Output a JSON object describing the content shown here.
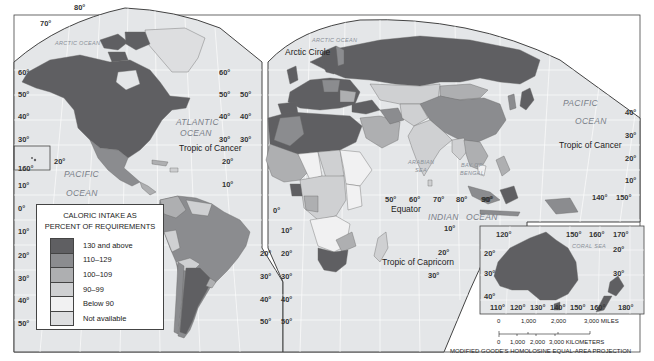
{
  "map": {
    "title": "Caloric intake as percent of requirements",
    "projection": "MODIFIED GOODE'S HOMOLOSINE EQUAL-AREA PROJECTION",
    "colors": {
      "frame": "#444444",
      "ocean": "#e4e6e8",
      "grid": "#ffffff",
      "cat_130_plus": "#5f5f62",
      "cat_110_129": "#8b8c8f",
      "cat_100_109": "#aeafb1",
      "cat_90_99": "#cfd0d2",
      "cat_below_90": "#f1f1f2",
      "cat_na": "#dddee0"
    }
  },
  "legend": {
    "title_line1": "CALORIC INTAKE AS",
    "title_line2": "PERCENT OF REQUIREMENTS",
    "items": [
      {
        "label": "130 and above",
        "color": "#5f5f62"
      },
      {
        "label": "110–129",
        "color": "#8b8c8f"
      },
      {
        "label": "100–109",
        "color": "#aeafb1"
      },
      {
        "label": "90–99",
        "color": "#cfd0d2"
      },
      {
        "label": "Below 90",
        "color": "#f1f1f2"
      },
      {
        "label": "Not available",
        "color": "#dddee0"
      }
    ]
  },
  "labels": {
    "oceans": {
      "arctic_west": "ARCTIC OCEAN",
      "arctic_east": "ARCTIC OCEAN",
      "atlantic_1": "ATLANTIC",
      "atlantic_2": "OCEAN",
      "pacific_west_1": "PACIFIC",
      "pacific_west_2": "OCEAN",
      "pacific_east_1": "PACIFIC",
      "pacific_east_2": "OCEAN",
      "indian_1": "INDIAN",
      "indian_2": "OCEAN",
      "arabian_1": "ARABIAN",
      "arabian_2": "SEA",
      "bengal_1": "BAY OF",
      "bengal_2": "BENGAL",
      "coral": "CORAL SEA"
    },
    "lines": {
      "arctic_circle": "Arctic Circle",
      "tropic_cancer_atlantic": "Tropic of Cancer",
      "tropic_cancer_pacific": "Tropic of Cancer",
      "equator": "Equator",
      "tropic_capricorn": "Tropic of Capricorn"
    },
    "degrees": {
      "na_80": "80°",
      "na_70": "70°",
      "na_60": "60°",
      "na_50": "50°",
      "na_40": "40°",
      "na_30": "30°",
      "hawaii_160": "160°",
      "hawaii_20": "20°",
      "pac_10": "10°",
      "pac_0": "0°",
      "pac_s10": "10°",
      "pac_s20": "20°",
      "pac_s30": "30°",
      "pac_s40": "40°",
      "pac_s50": "50°",
      "atl_60": "60°",
      "atl_50": "50°",
      "atl_40": "40°",
      "atl_30": "30°",
      "atl_20": "20°",
      "atl_10": "10°",
      "eu_50": "50°",
      "eu_40": "40°",
      "eu_30": "30°",
      "af_0": "0°",
      "satl_20": "20°",
      "satl_30": "30°",
      "satl_40": "40°",
      "satl_50": "50°",
      "af_10": "10°",
      "af_20": "20°",
      "af_30": "30°",
      "af_40": "40°",
      "af_50": "50°",
      "ind_50": "50°",
      "ind_60": "60°",
      "ind_70": "70°",
      "ind_80": "80°",
      "ind_90": "90°",
      "ind_s10": "10°",
      "ind_s20": "20°",
      "ind_s30": "30°",
      "asia_90": "90°",
      "epac_40": "40°",
      "epac_30": "30°",
      "epac_20": "20°",
      "epac_10": "10°",
      "epac_140": "140°",
      "epac_150": "150°",
      "au_120t": "120°",
      "au_150": "150°",
      "au_160": "160°",
      "au_170": "170°",
      "au_20": "20°",
      "au_30": "30°",
      "au_40": "40°",
      "au_e20": "20°",
      "au_e30": "30°",
      "au_110": "110°",
      "au_120": "120°",
      "au_130": "130°",
      "au_140": "140°",
      "au_150b": "150°",
      "au_160b": "160°",
      "au_180": "180°"
    }
  },
  "scale_bar": {
    "miles": [
      "0",
      "1,000",
      "2,000",
      "3,000 MILES"
    ],
    "km": [
      "0",
      "1,000",
      "2,000",
      "3,000 KILOMETERS"
    ]
  }
}
